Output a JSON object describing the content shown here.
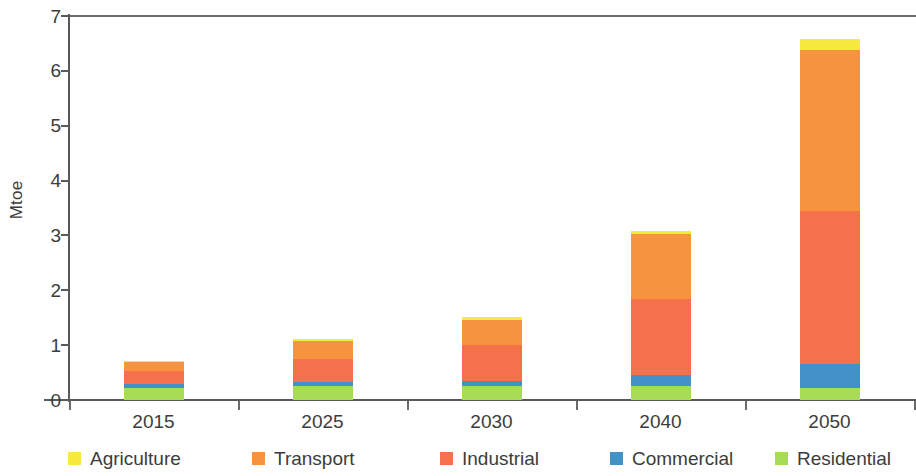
{
  "chart_data": {
    "type": "bar",
    "subtype": "stacked-bar",
    "title": "",
    "xlabel": "",
    "ylabel": "Mtoe",
    "categories": [
      "2015",
      "2025",
      "2030",
      "2040",
      "2050"
    ],
    "ylim": [
      0,
      7
    ],
    "ytick_labels": [
      "0",
      "1",
      "2",
      "3",
      "4",
      "5",
      "6",
      "7"
    ],
    "ytick_values": [
      0,
      1,
      2,
      3,
      4,
      5,
      6,
      7
    ],
    "grid": false,
    "legend_position": "bottom",
    "stack_order_bottom_to_top": [
      "Residential",
      "Commercial",
      "Industrial",
      "Transport",
      "Agriculture"
    ],
    "series": [
      {
        "name": "Residential",
        "color": "#a8dc54",
        "values": [
          0.22,
          0.25,
          0.26,
          0.26,
          0.22
        ]
      },
      {
        "name": "Commercial",
        "color": "#4292c8",
        "values": [
          0.07,
          0.08,
          0.09,
          0.19,
          0.44
        ]
      },
      {
        "name": "Industrial",
        "color": "#f4714c",
        "values": [
          0.24,
          0.42,
          0.66,
          1.39,
          2.79
        ]
      },
      {
        "name": "Transport",
        "color": "#f5933f",
        "values": [
          0.17,
          0.32,
          0.45,
          1.18,
          2.93
        ]
      },
      {
        "name": "Agriculture",
        "color": "#f7ea3c",
        "values": [
          0.02,
          0.04,
          0.05,
          0.07,
          0.2
        ]
      }
    ],
    "totals": [
      0.72,
      1.11,
      1.51,
      3.06,
      6.58
    ]
  },
  "legend": {
    "items": [
      {
        "label": "Agriculture",
        "color": "#f7ea3c"
      },
      {
        "label": "Transport",
        "color": "#f5933f"
      },
      {
        "label": "Industrial",
        "color": "#f4714c"
      },
      {
        "label": "Commercial",
        "color": "#4292c8"
      },
      {
        "label": "Residential",
        "color": "#a8dc54"
      }
    ]
  },
  "axes": {
    "y_title": "Mtoe",
    "axis_color": "#5a5a5a"
  }
}
